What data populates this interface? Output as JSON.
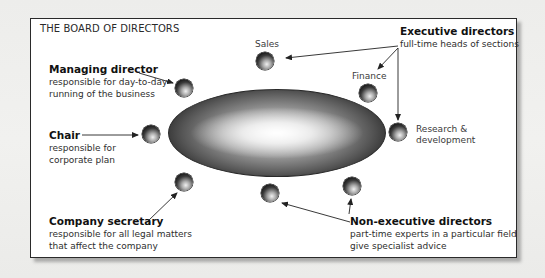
{
  "diagram": {
    "title": "THE BOARD OF DIRECTORS",
    "center_shape": "board-table-ellipse",
    "roles": {
      "executive_directors": {
        "head": "Executive directors",
        "desc": "full-time heads of sections"
      },
      "managing_director": {
        "head": "Managing director",
        "desc_line1": "responsible for day-to-day",
        "desc_line2": "running of the business"
      },
      "chair": {
        "head": "Chair",
        "desc_line1": "responsible for",
        "desc_line2": "corporate plan"
      },
      "company_secretary": {
        "head": "Company secretary",
        "desc_line1": "responsible for all legal matters",
        "desc_line2": "that affect the company"
      },
      "non_executive_directors": {
        "head": "Non-executive directors",
        "desc_line1": "part-time experts in a particular field",
        "desc_line2": "give specialist advice"
      }
    },
    "seat_labels": {
      "sales": "Sales",
      "finance": "Finance",
      "rnd_line1": "Research &",
      "rnd_line2": "development"
    },
    "seats": [
      {
        "id": "sales",
        "x": 256,
        "y": 52
      },
      {
        "id": "finance",
        "x": 359,
        "y": 84
      },
      {
        "id": "research-development",
        "x": 389,
        "y": 123
      },
      {
        "id": "managing-director",
        "x": 175,
        "y": 79
      },
      {
        "id": "chair",
        "x": 142,
        "y": 125
      },
      {
        "id": "company-secretary",
        "x": 175,
        "y": 173
      },
      {
        "id": "non-executive-1",
        "x": 261,
        "y": 184
      },
      {
        "id": "non-executive-2",
        "x": 343,
        "y": 177
      }
    ]
  }
}
